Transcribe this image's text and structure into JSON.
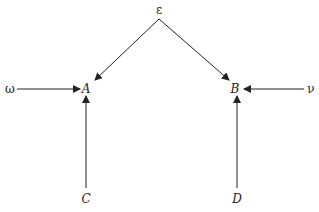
{
  "diagram": {
    "type": "directed-graph",
    "colors": {
      "stroke": "#222222",
      "background": "#ffffff"
    },
    "nodes": [
      {
        "id": "epsilon",
        "label": "ε",
        "italic": false,
        "x": 159,
        "y": 14
      },
      {
        "id": "A",
        "label": "A",
        "italic": true,
        "x": 86,
        "y": 93
      },
      {
        "id": "B",
        "label": "B",
        "italic": true,
        "x": 235,
        "y": 93
      },
      {
        "id": "omega",
        "label": "ω",
        "italic": false,
        "x": 10,
        "y": 93
      },
      {
        "id": "nu",
        "label": "ν",
        "italic": false,
        "x": 311,
        "y": 93
      },
      {
        "id": "C",
        "label": "C",
        "italic": true,
        "x": 86,
        "y": 203
      },
      {
        "id": "D",
        "label": "D",
        "italic": true,
        "x": 237,
        "y": 203
      }
    ],
    "edges": [
      {
        "from": "epsilon",
        "to": "A"
      },
      {
        "from": "epsilon",
        "to": "B"
      },
      {
        "from": "omega",
        "to": "A"
      },
      {
        "from": "nu",
        "to": "B"
      },
      {
        "from": "C",
        "to": "A"
      },
      {
        "from": "D",
        "to": "B"
      }
    ]
  }
}
